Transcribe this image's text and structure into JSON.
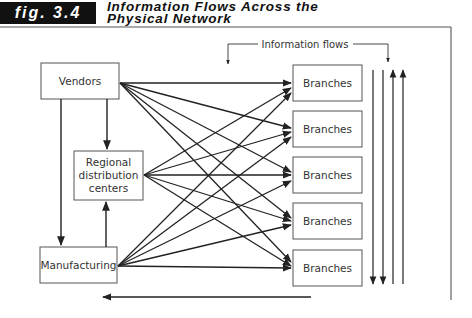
{
  "figure": {
    "tag": "fig. 3.4",
    "title_line1": "Information Flows Across the",
    "title_line2": "Physical Network"
  },
  "nodes": {
    "vendors": "Vendors",
    "regional_line1": "Regional",
    "regional_line2": "distribution",
    "regional_line3": "centers",
    "manufacturing": "Manufacturing",
    "branches": [
      "Branches",
      "Branches",
      "Branches",
      "Branches",
      "Branches"
    ]
  },
  "annotations": {
    "information_flows": "Information flows"
  },
  "edges": [
    {
      "from": "Vendors",
      "to": "Regional distribution centers"
    },
    {
      "from": "Vendors",
      "to": "Manufacturing"
    },
    {
      "from": "Manufacturing",
      "to": "Regional distribution centers"
    },
    {
      "from": "Vendors",
      "to": "Branches (x5)"
    },
    {
      "from": "Regional distribution centers",
      "to": "Branches (x5)"
    },
    {
      "from": "Manufacturing",
      "to": "Branches (x5)"
    }
  ]
}
